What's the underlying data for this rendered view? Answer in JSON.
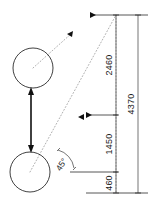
{
  "drawing": {
    "title": "Cylinder travel dimension sketch",
    "background_color": "#ffffff",
    "line_color": "#2b2b2b",
    "dotted_color": "#9a9a9a",
    "arrow_color": "#111111",
    "units": "mm"
  },
  "parts": {
    "upper_circle": {
      "name": "upper-cylinder",
      "cx": 33,
      "cy": 68,
      "r": 20
    },
    "lower_circle": {
      "name": "lower-cylinder",
      "cx": 30,
      "cy": 172,
      "r": 20
    },
    "stroke_arrow": {
      "name": "stroke-travel-arrow",
      "x": 31,
      "y_top": 88,
      "y_bottom": 152
    }
  },
  "annotations": {
    "angle_label": "45°",
    "angle_label_x": 64,
    "angle_label_y": 166
  },
  "dimensions": {
    "segments": [
      {
        "label": "2460",
        "from_y": 15,
        "to_y": 115,
        "line_x": 116
      },
      {
        "label": "1450",
        "from_y": 115,
        "to_y": 172,
        "line_x": 116
      },
      {
        "label": "460",
        "from_y": 172,
        "to_y": 193,
        "line_x": 116
      }
    ],
    "overall": {
      "label": "4370",
      "from_y": 15,
      "to_y": 193,
      "line_x": 138
    }
  },
  "labels": {
    "dim_2460": "2460",
    "dim_1450": "1450",
    "dim_460": "460",
    "dim_4370": "4370",
    "angle": "45°"
  }
}
